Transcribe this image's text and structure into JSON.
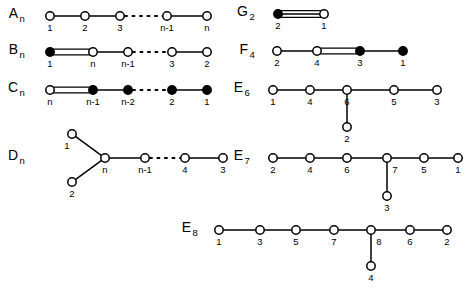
{
  "figure": {
    "kind": "dynkin-diagram-chart",
    "background": "#ffffff",
    "ink": "#000000",
    "width": 467,
    "height": 289,
    "node_open_fill": "#ffffff",
    "node_filled_fill": "#000000"
  },
  "chart_data": {
    "type": "diagram",
    "title": "",
    "subtitle": "",
    "xlabel": "",
    "ylabel": "",
    "grid": false,
    "legend": null,
    "node_styles": [
      "open",
      "filled"
    ],
    "edge_styles": [
      "single",
      "double",
      "triple",
      "dashed"
    ],
    "diagrams": [
      {
        "name": "A_n",
        "name_base": "A",
        "name_sub": "n",
        "label_x": 18,
        "label_y": 18,
        "nodes": [
          {
            "id": "a1",
            "label": "1",
            "x": 50,
            "y": 16,
            "style": "open",
            "label_pos": "below"
          },
          {
            "id": "a2",
            "label": "2",
            "x": 85,
            "y": 16,
            "style": "open",
            "label_pos": "below"
          },
          {
            "id": "a3",
            "label": "3",
            "x": 120,
            "y": 16,
            "style": "open",
            "label_pos": "below"
          },
          {
            "id": "a4",
            "label": "n-1",
            "x": 167,
            "y": 16,
            "style": "open",
            "label_pos": "below"
          },
          {
            "id": "a5",
            "label": "n",
            "x": 207,
            "y": 16,
            "style": "open",
            "label_pos": "below"
          }
        ],
        "edges": [
          {
            "from": "a1",
            "to": "a2",
            "style": "single"
          },
          {
            "from": "a2",
            "to": "a3",
            "style": "single"
          },
          {
            "from": "a3",
            "to": "a4",
            "style": "dashed"
          },
          {
            "from": "a4",
            "to": "a5",
            "style": "single"
          }
        ]
      },
      {
        "name": "B_n",
        "name_base": "B",
        "name_sub": "n",
        "label_x": 18,
        "label_y": 54,
        "nodes": [
          {
            "id": "b1",
            "label": "1",
            "x": 50,
            "y": 52,
            "style": "filled",
            "label_pos": "below"
          },
          {
            "id": "b2",
            "label": "n",
            "x": 93,
            "y": 52,
            "style": "open",
            "label_pos": "below"
          },
          {
            "id": "b3",
            "label": "n-1",
            "x": 128,
            "y": 52,
            "style": "open",
            "label_pos": "below"
          },
          {
            "id": "b4",
            "label": "3",
            "x": 172,
            "y": 52,
            "style": "open",
            "label_pos": "below"
          },
          {
            "id": "b5",
            "label": "2",
            "x": 207,
            "y": 52,
            "style": "open",
            "label_pos": "below"
          }
        ],
        "edges": [
          {
            "from": "b1",
            "to": "b2",
            "style": "double"
          },
          {
            "from": "b2",
            "to": "b3",
            "style": "single"
          },
          {
            "from": "b3",
            "to": "b4",
            "style": "dashed"
          },
          {
            "from": "b4",
            "to": "b5",
            "style": "single"
          }
        ]
      },
      {
        "name": "C_n",
        "name_base": "C",
        "name_sub": "n",
        "label_x": 18,
        "label_y": 92,
        "nodes": [
          {
            "id": "c1",
            "label": "n",
            "x": 50,
            "y": 90,
            "style": "open",
            "label_pos": "below"
          },
          {
            "id": "c2",
            "label": "n-1",
            "x": 93,
            "y": 90,
            "style": "filled",
            "label_pos": "below"
          },
          {
            "id": "c3",
            "label": "n-2",
            "x": 128,
            "y": 90,
            "style": "filled",
            "label_pos": "below"
          },
          {
            "id": "c4",
            "label": "2",
            "x": 172,
            "y": 90,
            "style": "filled",
            "label_pos": "below"
          },
          {
            "id": "c5",
            "label": "1",
            "x": 207,
            "y": 90,
            "style": "filled",
            "label_pos": "below"
          }
        ],
        "edges": [
          {
            "from": "c1",
            "to": "c2",
            "style": "double"
          },
          {
            "from": "c2",
            "to": "c3",
            "style": "single"
          },
          {
            "from": "c3",
            "to": "c4",
            "style": "dashed"
          },
          {
            "from": "c4",
            "to": "c5",
            "style": "single"
          }
        ]
      },
      {
        "name": "D_n",
        "name_base": "D",
        "name_sub": "n",
        "label_x": 18,
        "label_y": 160,
        "nodes": [
          {
            "id": "d1",
            "label": "1",
            "x": 72,
            "y": 134,
            "style": "open",
            "label_pos": "below-left"
          },
          {
            "id": "d2",
            "label": "2",
            "x": 72,
            "y": 182,
            "style": "open",
            "label_pos": "below"
          },
          {
            "id": "d3",
            "label": "n",
            "x": 105,
            "y": 158,
            "style": "open",
            "label_pos": "below"
          },
          {
            "id": "d4",
            "label": "n-1",
            "x": 145,
            "y": 158,
            "style": "open",
            "label_pos": "below"
          },
          {
            "id": "d5",
            "label": "4",
            "x": 185,
            "y": 158,
            "style": "open",
            "label_pos": "below"
          },
          {
            "id": "d6",
            "label": "3",
            "x": 223,
            "y": 158,
            "style": "open",
            "label_pos": "below"
          }
        ],
        "edges": [
          {
            "from": "d1",
            "to": "d3",
            "style": "single"
          },
          {
            "from": "d2",
            "to": "d3",
            "style": "single"
          },
          {
            "from": "d3",
            "to": "d4",
            "style": "single"
          },
          {
            "from": "d4",
            "to": "d5",
            "style": "dashed"
          },
          {
            "from": "d5",
            "to": "d6",
            "style": "single"
          }
        ]
      },
      {
        "name": "G_2",
        "name_base": "G",
        "name_sub": "2",
        "label_x": 248,
        "label_y": 16,
        "nodes": [
          {
            "id": "g1",
            "label": "2",
            "x": 278,
            "y": 14,
            "style": "filled",
            "label_pos": "below"
          },
          {
            "id": "g2",
            "label": "1",
            "x": 324,
            "y": 14,
            "style": "open",
            "label_pos": "below"
          }
        ],
        "edges": [
          {
            "from": "g1",
            "to": "g2",
            "style": "triple"
          }
        ]
      },
      {
        "name": "F_4",
        "name_base": "F",
        "name_sub": "4",
        "label_x": 248,
        "label_y": 54,
        "nodes": [
          {
            "id": "f1",
            "label": "2",
            "x": 277,
            "y": 51,
            "style": "open",
            "label_pos": "below"
          },
          {
            "id": "f2",
            "label": "4",
            "x": 317,
            "y": 51,
            "style": "open",
            "label_pos": "below"
          },
          {
            "id": "f3",
            "label": "3",
            "x": 360,
            "y": 51,
            "style": "filled",
            "label_pos": "below"
          },
          {
            "id": "f4",
            "label": "1",
            "x": 403,
            "y": 51,
            "style": "filled",
            "label_pos": "below"
          }
        ],
        "edges": [
          {
            "from": "f1",
            "to": "f2",
            "style": "single"
          },
          {
            "from": "f2",
            "to": "f3",
            "style": "double"
          },
          {
            "from": "f3",
            "to": "f4",
            "style": "single"
          }
        ]
      },
      {
        "name": "E_6",
        "name_base": "E",
        "name_sub": "6",
        "label_x": 243,
        "label_y": 92,
        "nodes": [
          {
            "id": "e61",
            "label": "1",
            "x": 273,
            "y": 90,
            "style": "open",
            "label_pos": "below"
          },
          {
            "id": "e64",
            "label": "4",
            "x": 310,
            "y": 90,
            "style": "open",
            "label_pos": "below"
          },
          {
            "id": "e66",
            "label": "6",
            "x": 347,
            "y": 90,
            "style": "open",
            "label_pos": "below"
          },
          {
            "id": "e65",
            "label": "5",
            "x": 394,
            "y": 90,
            "style": "open",
            "label_pos": "below"
          },
          {
            "id": "e63",
            "label": "3",
            "x": 437,
            "y": 90,
            "style": "open",
            "label_pos": "below"
          },
          {
            "id": "e62",
            "label": "2",
            "x": 347,
            "y": 127,
            "style": "open",
            "label_pos": "below"
          }
        ],
        "edges": [
          {
            "from": "e61",
            "to": "e64",
            "style": "single"
          },
          {
            "from": "e64",
            "to": "e66",
            "style": "single"
          },
          {
            "from": "e66",
            "to": "e65",
            "style": "single"
          },
          {
            "from": "e65",
            "to": "e63",
            "style": "single"
          },
          {
            "from": "e66",
            "to": "e62",
            "style": "single"
          }
        ]
      },
      {
        "name": "E_7",
        "name_base": "E",
        "name_sub": "7",
        "label_x": 243,
        "label_y": 160,
        "nodes": [
          {
            "id": "e72",
            "label": "2",
            "x": 273,
            "y": 158,
            "style": "open",
            "label_pos": "below"
          },
          {
            "id": "e74",
            "label": "4",
            "x": 310,
            "y": 158,
            "style": "open",
            "label_pos": "below"
          },
          {
            "id": "e76",
            "label": "6",
            "x": 347,
            "y": 158,
            "style": "open",
            "label_pos": "below"
          },
          {
            "id": "e77",
            "label": "7",
            "x": 387,
            "y": 158,
            "style": "open",
            "label_pos": "below-right"
          },
          {
            "id": "e75",
            "label": "5",
            "x": 424,
            "y": 158,
            "style": "open",
            "label_pos": "below"
          },
          {
            "id": "e71",
            "label": "1",
            "x": 458,
            "y": 158,
            "style": "open",
            "label_pos": "below"
          },
          {
            "id": "e73",
            "label": "3",
            "x": 387,
            "y": 196,
            "style": "open",
            "label_pos": "below"
          }
        ],
        "edges": [
          {
            "from": "e72",
            "to": "e74",
            "style": "single"
          },
          {
            "from": "e74",
            "to": "e76",
            "style": "single"
          },
          {
            "from": "e76",
            "to": "e77",
            "style": "single"
          },
          {
            "from": "e77",
            "to": "e75",
            "style": "single"
          },
          {
            "from": "e75",
            "to": "e71",
            "style": "single"
          },
          {
            "from": "e77",
            "to": "e73",
            "style": "single"
          }
        ]
      },
      {
        "name": "E_8",
        "name_base": "E",
        "name_sub": "8",
        "label_x": 191,
        "label_y": 232,
        "nodes": [
          {
            "id": "e81",
            "label": "1",
            "x": 219,
            "y": 230,
            "style": "open",
            "label_pos": "below"
          },
          {
            "id": "e83",
            "label": "3",
            "x": 260,
            "y": 230,
            "style": "open",
            "label_pos": "below"
          },
          {
            "id": "e85",
            "label": "5",
            "x": 296,
            "y": 230,
            "style": "open",
            "label_pos": "below"
          },
          {
            "id": "e87",
            "label": "7",
            "x": 334,
            "y": 230,
            "style": "open",
            "label_pos": "below"
          },
          {
            "id": "e88",
            "label": "8",
            "x": 371,
            "y": 230,
            "style": "open",
            "label_pos": "below-right"
          },
          {
            "id": "e86",
            "label": "6",
            "x": 410,
            "y": 230,
            "style": "open",
            "label_pos": "below"
          },
          {
            "id": "e82",
            "label": "2",
            "x": 447,
            "y": 230,
            "style": "open",
            "label_pos": "below"
          },
          {
            "id": "e84",
            "label": "4",
            "x": 371,
            "y": 266,
            "style": "open",
            "label_pos": "below"
          }
        ],
        "edges": [
          {
            "from": "e81",
            "to": "e83",
            "style": "single"
          },
          {
            "from": "e83",
            "to": "e85",
            "style": "single"
          },
          {
            "from": "e85",
            "to": "e87",
            "style": "single"
          },
          {
            "from": "e87",
            "to": "e88",
            "style": "single"
          },
          {
            "from": "e88",
            "to": "e86",
            "style": "single"
          },
          {
            "from": "e86",
            "to": "e82",
            "style": "single"
          },
          {
            "from": "e88",
            "to": "e84",
            "style": "single"
          }
        ]
      }
    ]
  }
}
